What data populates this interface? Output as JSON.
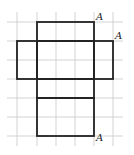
{
  "diagram": {
    "type": "box-net-on-grid",
    "grid": {
      "x_lines": [
        17,
        37,
        56,
        75,
        94,
        113
      ],
      "y_lines": [
        22,
        41,
        60,
        79,
        98,
        117,
        136
      ],
      "x_extent": [
        7,
        123
      ],
      "y_extent": [
        12,
        146
      ],
      "color": "#c8c8c8"
    },
    "net_color": "#222222",
    "faces": [
      {
        "name": "top-face",
        "x": 37,
        "y": 22,
        "w": 57,
        "h": 19
      },
      {
        "name": "left-face",
        "x": 17,
        "y": 41,
        "w": 20,
        "h": 38
      },
      {
        "name": "front-face",
        "x": 37,
        "y": 41,
        "w": 57,
        "h": 38
      },
      {
        "name": "right-face",
        "x": 94,
        "y": 41,
        "w": 19,
        "h": 38
      },
      {
        "name": "bottom-face",
        "x": 37,
        "y": 79,
        "w": 57,
        "h": 19
      },
      {
        "name": "back-face",
        "x": 37,
        "y": 98,
        "w": 57,
        "h": 38
      }
    ],
    "labels": [
      {
        "text": "A",
        "x": 96,
        "y": 20
      },
      {
        "text": "A",
        "x": 115,
        "y": 39
      },
      {
        "text": "A",
        "x": 96,
        "y": 141
      }
    ]
  }
}
